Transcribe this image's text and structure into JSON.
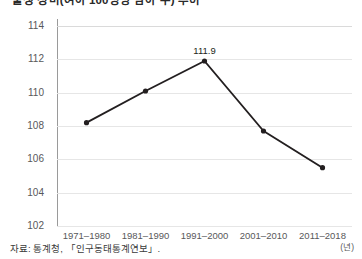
{
  "title": "출생 성비(여아 100명당 남아 수) 추이",
  "axis": {
    "x_unit": "(년)",
    "y_ticks": [
      114,
      112,
      110,
      108,
      106,
      104,
      102
    ],
    "y_min": 102,
    "y_max": 114
  },
  "footer": {
    "source": "자료: 통계청, 「인구동태통계연보」."
  },
  "chart_data": {
    "type": "line",
    "title": "출생 성비(여아 100명당 남아 수) 추이",
    "xlabel": "(년)",
    "ylabel": "",
    "ylim": [
      102,
      114
    ],
    "ytick_step": 2,
    "grid": true,
    "legend": "none",
    "marker": "circle",
    "line_color": "#231f20",
    "categories": [
      "1971-1980",
      "1981-1990",
      "1991-2000",
      "2001-2010",
      "2011-2018"
    ],
    "values": [
      108.2,
      110.1,
      111.9,
      107.7,
      105.5
    ],
    "point_labels": [
      null,
      null,
      "111.9",
      null,
      null
    ],
    "annotations": [
      {
        "category": "1991-2000",
        "value": 111.9,
        "text": "111.9"
      }
    ]
  }
}
